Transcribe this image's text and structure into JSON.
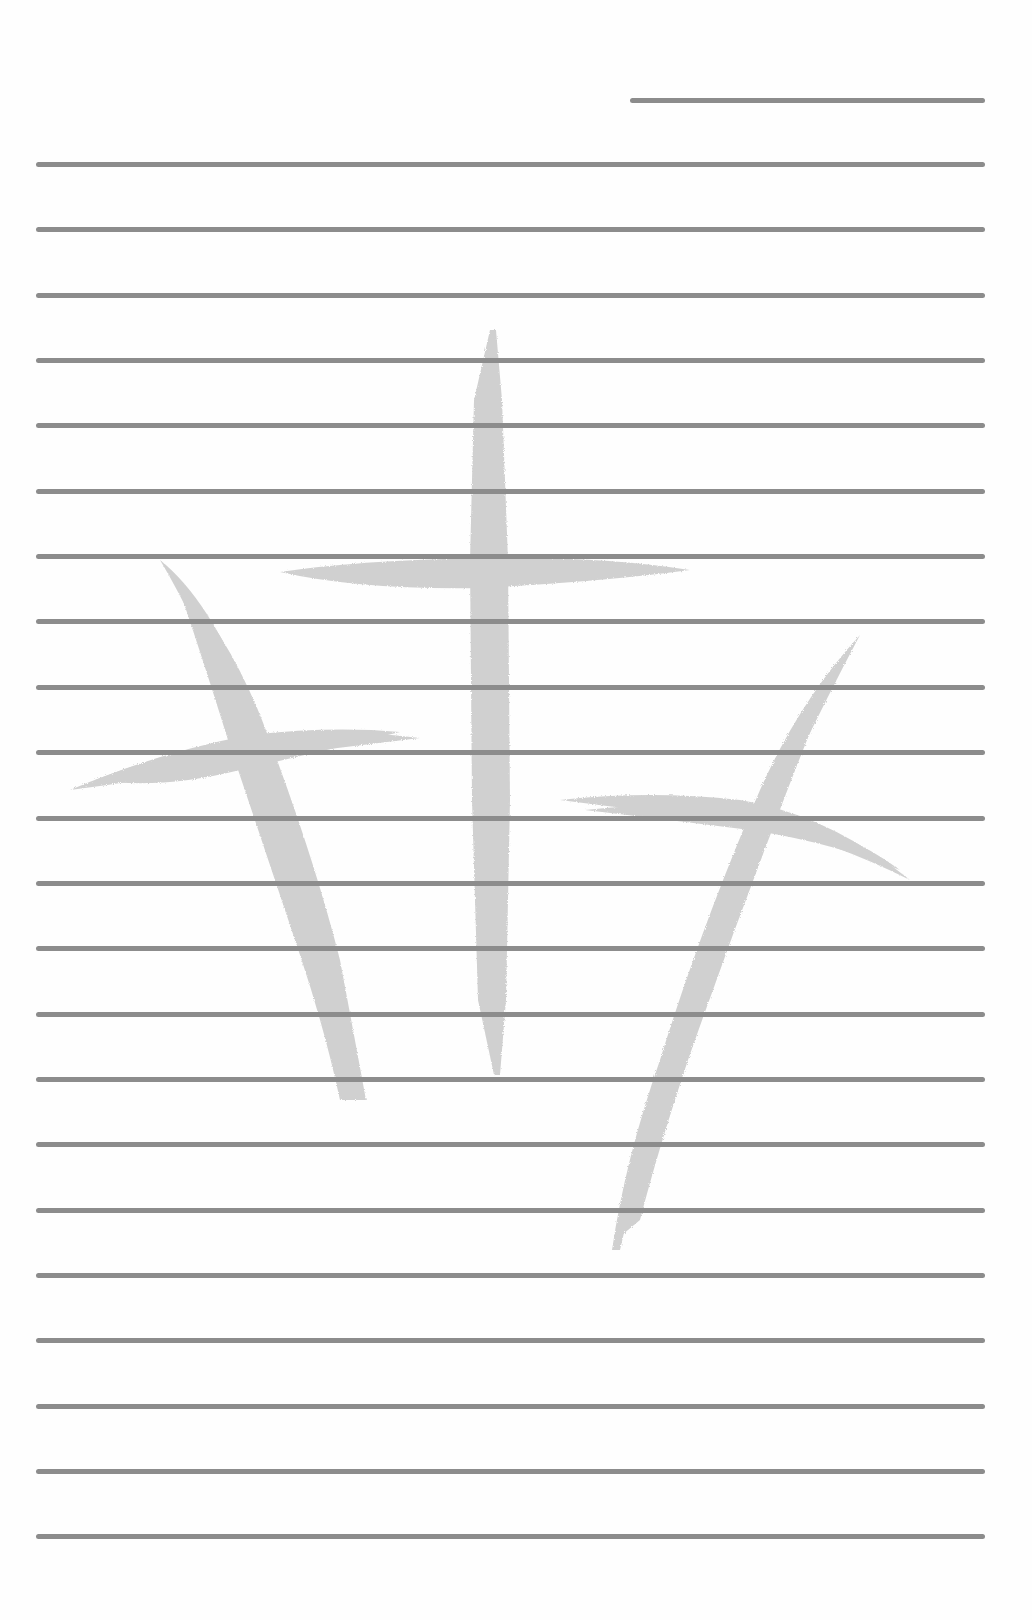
{
  "page": {
    "type": "lined-stationery",
    "background": "#fefefe",
    "rule_color": "#8c8c8c",
    "rule_thickness": 5
  },
  "header_line": {
    "x1": 630,
    "x2": 985,
    "y": 100
  },
  "ruled_lines": {
    "x1": 36,
    "x2": 985,
    "start_y": 164,
    "spacing": 65.35,
    "count": 22
  },
  "watermark": {
    "description": "three brush-stroke crosses",
    "color": "#c8c8c8",
    "crosses": [
      {
        "name": "left-cross",
        "position": "left, tilted"
      },
      {
        "name": "center-cross",
        "position": "center, upright"
      },
      {
        "name": "right-cross",
        "position": "right, tilted"
      }
    ]
  }
}
